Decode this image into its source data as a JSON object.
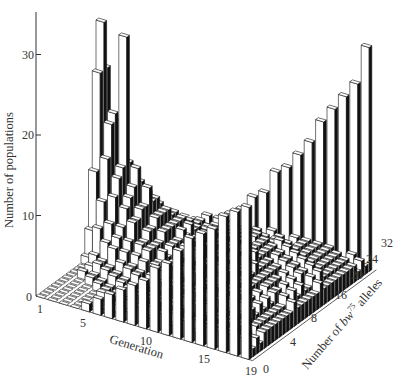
{
  "chart_data": {
    "type": "bar3d",
    "title": "",
    "ylabel": "Number of populations",
    "xlabel": "Generation",
    "zlabel": "Number of bw75 alleles",
    "zlabel_parts": {
      "prefix": "Number of ",
      "italic": "bw",
      "superscript": "75",
      "suffix": " alleles"
    },
    "y_ticks": [
      0,
      10,
      20,
      30
    ],
    "x_ticks": [
      1,
      5,
      10,
      15,
      19
    ],
    "z_ticks": [
      0,
      4,
      8,
      16,
      20,
      24,
      32
    ],
    "ylim": [
      0,
      35
    ],
    "generations": [
      1,
      2,
      3,
      4,
      5,
      6,
      7,
      8,
      9,
      10,
      11,
      12,
      13,
      14,
      15,
      16,
      17,
      18,
      19
    ],
    "allele_counts": [
      0,
      1,
      2,
      3,
      4,
      5,
      6,
      7,
      8,
      9,
      10,
      11,
      12,
      13,
      14,
      15,
      16,
      17,
      18,
      19,
      20,
      21,
      22,
      23,
      24,
      25,
      26,
      27,
      28,
      29,
      30,
      31,
      32
    ],
    "series": [
      {
        "name": "0 alleles (lost)",
        "values": [
          0,
          0,
          0,
          0,
          1,
          2,
          3,
          4,
          5,
          6,
          8,
          9,
          11,
          13,
          14,
          15,
          17,
          18,
          19
        ]
      },
      {
        "name": "16 alleles (initial)",
        "values": [
          0,
          0,
          28,
          12,
          10,
          7,
          6,
          5,
          4,
          4,
          3,
          3,
          2,
          2,
          2,
          1,
          1,
          1,
          1
        ]
      },
      {
        "name": "32 alleles (fixed)",
        "values": [
          0,
          0,
          0,
          0,
          1,
          1,
          2,
          3,
          5,
          6,
          9,
          10,
          12,
          14,
          17,
          19,
          21,
          23,
          28
        ]
      }
    ],
    "grid": false,
    "legend": "none"
  }
}
